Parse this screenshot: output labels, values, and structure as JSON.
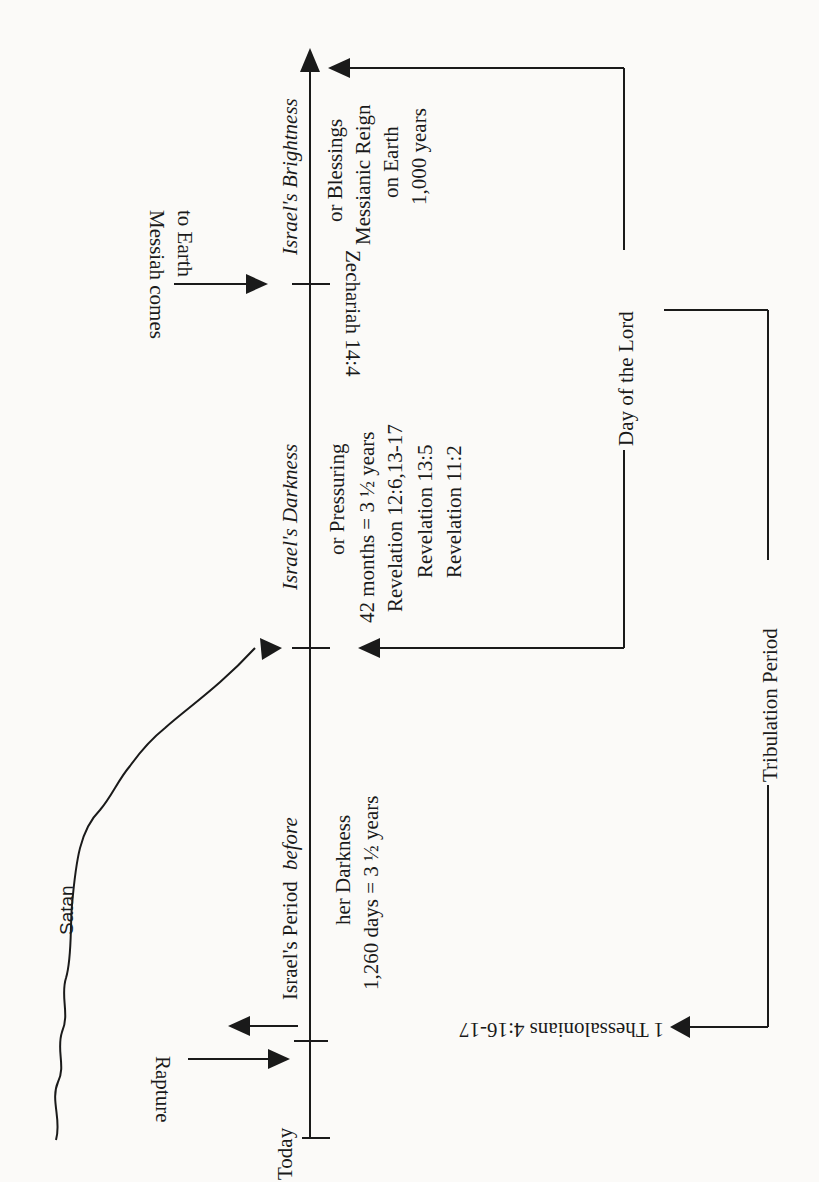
{
  "diagram": {
    "type": "timeline",
    "orientation": "rotated-90-ccw",
    "timeline": {
      "start_label": "Today",
      "periods": [
        {
          "id": "before-darkness",
          "heading": "Israel's Period",
          "heading_italic": "before",
          "line2": "her Darkness",
          "line3": "1,260 days = 3 ½ years"
        },
        {
          "id": "darkness",
          "heading": "Israel's Darkness",
          "line2": "or Pressuring",
          "line3": "42 months = 3 ½ years",
          "refs": [
            "Revelation 12:6,13-17",
            "Revelation 13:5",
            "Revelation 11:2"
          ]
        },
        {
          "id": "brightness",
          "heading": "Israel's Brightness",
          "line2": "or Blessings",
          "line3": "Messianic Reign",
          "line4": "on Earth",
          "line5": "1,000 years"
        }
      ]
    },
    "events": {
      "rapture": "Rapture",
      "satan": "Satan",
      "messiah_line1": "Messiah comes",
      "messiah_line2": "to Earth",
      "zechariah": "Zechariah 14:4",
      "thessalonians": "1 Thessalonians 4:16-17"
    },
    "brackets": {
      "day_of_the_lord": "Day of the Lord",
      "tribulation_period": "Tribulation Period"
    }
  }
}
